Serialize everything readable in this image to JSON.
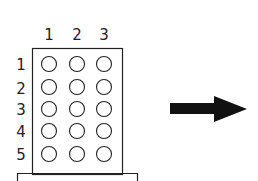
{
  "diagram": {
    "column_labels": [
      "1",
      "2",
      "3"
    ],
    "row_labels": [
      "1",
      "2",
      "3",
      "4",
      "5"
    ],
    "grid": {
      "rows": 5,
      "cols": 3,
      "cell_shape": "circle",
      "filled": false
    },
    "arrow": {
      "direction": "right",
      "color": "#111111"
    },
    "stroke_color": "#222222"
  }
}
